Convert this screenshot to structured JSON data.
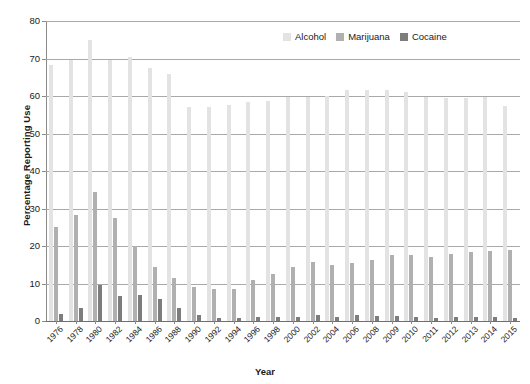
{
  "chart_data": {
    "type": "bar",
    "title": "",
    "xlabel": "Year",
    "ylabel": "Percentage Reporting Use",
    "ylim": [
      0,
      80
    ],
    "yticks": [
      0,
      10,
      20,
      30,
      40,
      50,
      60,
      70,
      80
    ],
    "grid": true,
    "legend_position": "top-right",
    "categories": [
      "1976",
      "1978",
      "1980",
      "1982",
      "1984",
      "1986",
      "1988",
      "1990",
      "1992",
      "1994",
      "1996",
      "1998",
      "2000",
      "2002",
      "2004",
      "2006",
      "2008",
      "2009",
      "2010",
      "2011",
      "2012",
      "2013",
      "2014",
      "2015"
    ],
    "series": [
      {
        "name": "Alcohol",
        "color": "#e3e3e3",
        "values": [
          68.3,
          69.7,
          75.0,
          69.7,
          70.4,
          67.6,
          65.9,
          57.1,
          57.2,
          57.5,
          58.5,
          58.6,
          59.7,
          59.7,
          60.1,
          61.5,
          61.5,
          61.7,
          61.2,
          59.8,
          59.4,
          59.5,
          59.8,
          57.4
        ]
      },
      {
        "name": "Marijuana",
        "color": "#b0b0b0",
        "values": [
          25.0,
          28.2,
          34.5,
          27.4,
          20.0,
          14.5,
          11.5,
          9.0,
          8.5,
          8.5,
          11.0,
          12.5,
          14.5,
          15.8,
          15.0,
          15.6,
          16.3,
          17.5,
          17.7,
          17.2,
          17.8,
          18.3,
          18.7,
          19.0
        ]
      },
      {
        "name": "Cocaine",
        "color": "#7d7d7d",
        "values": [
          2.0,
          3.5,
          9.5,
          6.8,
          7.0,
          6.0,
          3.5,
          1.5,
          0.8,
          0.8,
          1.0,
          1.2,
          1.2,
          1.5,
          1.0,
          1.5,
          1.3,
          1.3,
          1.1,
          0.9,
          1.0,
          1.0,
          1.0,
          0.9
        ]
      }
    ]
  },
  "legend": {
    "items": [
      {
        "label": "Alcohol",
        "color": "#e3e3e3"
      },
      {
        "label": "Marijuana",
        "color": "#b0b0b0"
      },
      {
        "label": "Cocaine",
        "color": "#7d7d7d"
      }
    ]
  },
  "axes": {
    "y_title": "Percentage Reporting Use",
    "x_title": "Year"
  }
}
